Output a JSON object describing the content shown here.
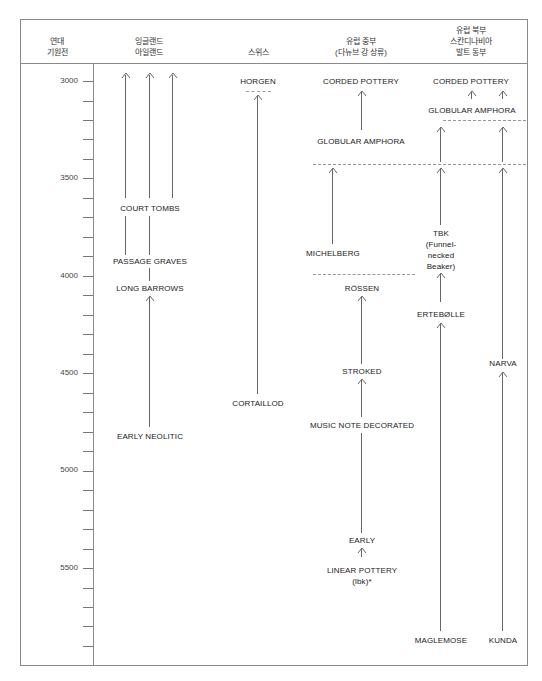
{
  "headers": {
    "date": [
      "연대",
      "기원전"
    ],
    "england": [
      "잉글랜드",
      "아일랜드"
    ],
    "swiss": [
      "스위스"
    ],
    "central": [
      "유럽 중부",
      "(다뉴브 강 상류)"
    ],
    "north": [
      "유럽 북부",
      "스칸디나비아",
      "발트 동부"
    ]
  },
  "axis": {
    "labels": [
      "3000",
      "3500",
      "4000",
      "4500",
      "5000",
      "5500"
    ]
  },
  "cultures": {
    "court_tombs": "COURT TOMBS",
    "passage_graves": "PASSAGE GRAVES",
    "long_barrows": "LONG BARROWS",
    "early_neolitic": "EARLY NEOLITIC",
    "horgen": "HORGEN",
    "cortaillod": "CORTAILLOD",
    "corded_pottery_central": "CORDED POTTERY",
    "globular_amphora_central": "GLOBULAR AMPHORA",
    "michelberg": "MICHELBERG",
    "rossen": "RÖSSEN",
    "stroked": "STROKED",
    "music_note": "MUSIC NOTE DECORATED",
    "early": "EARLY",
    "linear_pottery": [
      "LINEAR POTTERY",
      "(lbk)*"
    ],
    "corded_pottery_north": "CORDED POTTERY",
    "globular_amphora_north": "GLOBULAR AMPHORA",
    "tbk": [
      "TBK",
      "(Funnel-",
      "necked",
      "Beaker)"
    ],
    "ertebolle": "ERTEBØLLE",
    "narva": "NARVA",
    "maglemose": "MAGLEMOSE",
    "kunda": "KUNDA"
  },
  "chart_data": {
    "type": "timeline",
    "title": "",
    "axis_label": "연대 기원전",
    "axis_range": [
      3000,
      5900
    ],
    "tick_interval": 100,
    "columns": [
      {
        "name": "잉글랜드 아일랜드",
        "sequence": [
          "EARLY NEOLITIC",
          "LONG BARROWS",
          "PASSAGE GRAVES",
          "COURT TOMBS"
        ]
      },
      {
        "name": "스위스",
        "sequence": [
          "CORTAILLOD",
          "HORGEN"
        ]
      },
      {
        "name": "유럽 중부 (다뉴브 강 상류)",
        "sequence": [
          "LINEAR POTTERY (lbk)*",
          "EARLY",
          "MUSIC NOTE DECORATED",
          "STROKED",
          "RÖSSEN",
          "MICHELBERG",
          "GLOBULAR AMPHORA",
          "CORDED POTTERY"
        ]
      },
      {
        "name": "유럽 북부 스칸디나비아 발트 동부",
        "sequence": [
          "MAGLEMOSE",
          "ERTEBØLLE",
          "TBK (Funnel-necked Beaker)",
          "GLOBULAR AMPHORA",
          "CORDED POTTERY",
          "KUNDA",
          "NARVA"
        ]
      }
    ]
  }
}
